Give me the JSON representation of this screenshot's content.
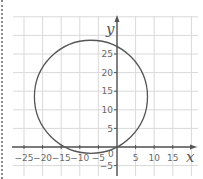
{
  "chart_data": {
    "type": "line",
    "title": "",
    "xlabel": "x",
    "ylabel": "y",
    "xlim": [
      -27,
      21
    ],
    "ylim": [
      -7,
      35
    ],
    "grid": true,
    "grid_step": 5,
    "x_ticks": [
      -25,
      -20,
      -15,
      -10,
      -5,
      5,
      10,
      15
    ],
    "x_tick_labels": [
      "-25",
      "-20",
      "-15",
      "-10",
      "-5",
      "5",
      "10",
      "15"
    ],
    "y_ticks": [
      -5,
      5,
      10,
      15,
      20,
      25
    ],
    "y_tick_labels": [
      "-5",
      "5",
      "10",
      "15",
      "20",
      "25"
    ],
    "origin_label": "0",
    "series": [
      {
        "name": "circle",
        "shape": "circle",
        "center": [
          -7,
          13.5
        ],
        "radius": 15.2,
        "passes_through": [
          [
            0,
            0
          ]
        ],
        "color": "#555555"
      }
    ],
    "colors": {
      "grid": "#d9d9d9",
      "axis": "#555555",
      "curve": "#555555",
      "text": "#6a6a6a"
    }
  }
}
